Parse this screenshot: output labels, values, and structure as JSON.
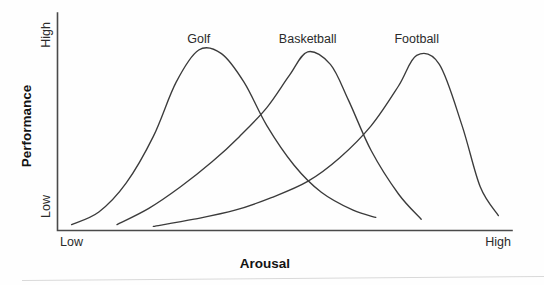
{
  "chart_data": {
    "type": "line",
    "title": "",
    "xlabel": "Arousal",
    "ylabel": "Performance",
    "xtick_labels": [
      "Low",
      "High"
    ],
    "ytick_labels": [
      "Low",
      "High"
    ],
    "xlim": [
      0,
      100
    ],
    "ylim": [
      0,
      100
    ],
    "grid": false,
    "legend": "inline-labels-above-peaks",
    "annotation": "Inverted-U (Yerkes-Dodson) curves: optimal arousal level increases with task gross-motor demand",
    "series": [
      {
        "name": "Golf",
        "label": "Golf",
        "label_x": 31,
        "label_y": 97,
        "optimal_arousal": 31,
        "peak_performance": 100,
        "x": [
          3,
          9,
          15,
          21,
          26,
          31,
          36,
          41,
          46,
          52,
          58,
          65,
          70
        ],
        "y": [
          3,
          10,
          26,
          52,
          82,
          100,
          98,
          82,
          58,
          36,
          21,
          11,
          7
        ]
      },
      {
        "name": "Basketball",
        "label": "Basketball",
        "label_x": 55,
        "label_y": 97,
        "optimal_arousal": 55,
        "peak_performance": 99,
        "x": [
          13,
          20,
          27,
          34,
          40,
          46,
          51,
          55,
          60,
          64,
          69,
          75,
          80
        ],
        "y": [
          3,
          12,
          24,
          38,
          52,
          68,
          86,
          99,
          92,
          72,
          44,
          20,
          6
        ]
      },
      {
        "name": "Football",
        "label": "Football",
        "label_x": 79,
        "label_y": 97,
        "optimal_arousal": 79,
        "peak_performance": 97,
        "x": [
          21,
          30,
          39,
          47,
          55,
          62,
          69,
          75,
          79,
          84,
          89,
          93,
          97
        ],
        "y": [
          2,
          6,
          11,
          18,
          27,
          40,
          58,
          80,
          97,
          92,
          58,
          24,
          8
        ]
      }
    ]
  },
  "axes": {
    "y_high_label": "High",
    "y_low_label": "Low",
    "y_title": "Performance",
    "x_low_label": "Low",
    "x_high_label": "High",
    "x_title": "Arousal"
  },
  "colors": {
    "background": "#fefefe",
    "axis": "#4a4a4a",
    "curve": "#3b3b3b",
    "text": "#2b2b2b",
    "title_text": "#131313"
  }
}
